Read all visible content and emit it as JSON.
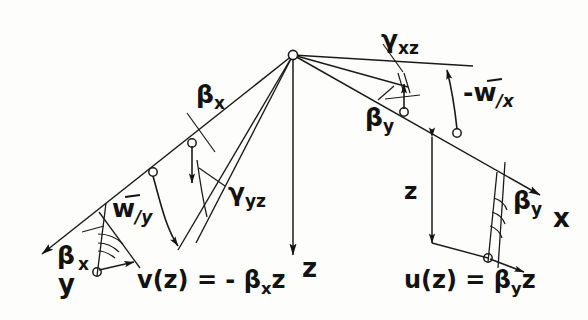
{
  "figure": {
    "type": "engineering-diagram",
    "background_color": "#fdfdfc",
    "line_color": "#1a1a1a"
  },
  "axes": [
    {
      "name": "y-axis",
      "label": "y",
      "direction": "down-left",
      "x": 58,
      "y": 288
    },
    {
      "name": "z-axis",
      "label": "z",
      "direction": "down",
      "x": 302,
      "y": 272
    },
    {
      "name": "x-axis",
      "label": "x",
      "direction": "down-right",
      "x": 553,
      "y": 222
    }
  ],
  "angle_labels": [
    {
      "name": "beta-x-upper",
      "base": "β",
      "sub": "x",
      "x": 196,
      "y": 82
    },
    {
      "name": "gamma-yz",
      "base": "γ",
      "sub": "yz",
      "x": 228,
      "y": 180
    },
    {
      "name": "beta-x-lower",
      "base": "β",
      "sub": "x",
      "x": 57,
      "y": 243
    },
    {
      "name": "gamma-xz",
      "base": "γ",
      "sub": "xz",
      "x": 381,
      "y": 27
    },
    {
      "name": "beta-y-upper",
      "base": "β",
      "sub": "y",
      "x": 365,
      "y": 105
    },
    {
      "name": "beta-y-lower",
      "base": "β",
      "sub": "y",
      "x": 513,
      "y": 188
    }
  ],
  "displacement_labels": [
    {
      "name": "w-prime-y",
      "prefix": "",
      "base": "w",
      "sub": "/y",
      "x": 112,
      "y": 196
    },
    {
      "name": "w-prime-x",
      "prefix": "-",
      "base": "w",
      "sub": "/x",
      "x": 463,
      "y": 80
    }
  ],
  "dimension_labels": [
    {
      "name": "z-dimension",
      "label": "z",
      "x": 404,
      "y": 180
    }
  ],
  "equations": [
    {
      "name": "v-equation",
      "text": "v(z) = - β",
      "sub": "x",
      "tail": "z",
      "x": 137,
      "y": 268
    },
    {
      "name": "u-equation",
      "text": "u(z) = β",
      "sub": "y",
      "tail": "z",
      "x": 404,
      "y": 268
    }
  ],
  "nodes": [
    {
      "name": "origin-node",
      "x": 293,
      "y": 55
    },
    {
      "name": "left-node-upper",
      "x": 192,
      "y": 143
    },
    {
      "name": "left-node-lower",
      "x": 153,
      "y": 172
    },
    {
      "name": "left-axis-node",
      "x": 97,
      "y": 272
    },
    {
      "name": "right-node-upper",
      "x": 404,
      "y": 112
    },
    {
      "name": "right-node-lower",
      "x": 457,
      "y": 133
    },
    {
      "name": "right-axis-node",
      "x": 488,
      "y": 258
    }
  ]
}
